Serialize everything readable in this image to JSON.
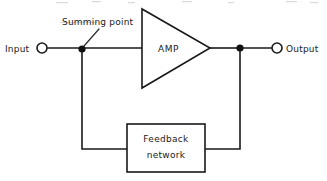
{
  "diagram": {
    "background_color": "#ffffff",
    "line_color": "#1a1a1a",
    "labels": {
      "input": "Input",
      "output": "Output",
      "summing_point": "Summing point",
      "amplifier": "AMP",
      "feedback_line1": "Feedback",
      "feedback_line2": "network"
    },
    "nodes": [
      {
        "name": "input-terminal",
        "type": "open-circle",
        "x": 42,
        "y": 48
      },
      {
        "name": "summing-point-junction",
        "type": "filled-dot",
        "x": 82,
        "y": 49
      },
      {
        "name": "amplifier-triangle",
        "type": "triangle",
        "x": 142,
        "y": 9,
        "width": 68,
        "height": 79
      },
      {
        "name": "output-junction",
        "type": "filled-dot",
        "x": 240,
        "y": 48
      },
      {
        "name": "output-terminal",
        "type": "open-circle",
        "x": 277,
        "y": 48
      },
      {
        "name": "feedback-box",
        "type": "rectangle",
        "x": 127,
        "y": 124,
        "width": 78,
        "height": 48
      }
    ]
  }
}
